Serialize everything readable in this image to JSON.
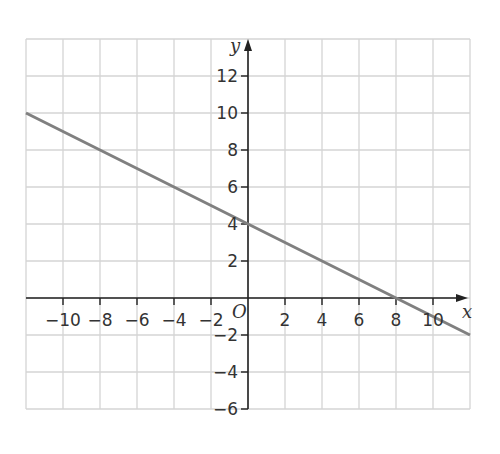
{
  "chart_data": {
    "type": "line",
    "title": "",
    "xlabel": "x",
    "ylabel": "y",
    "origin_label": "O",
    "xlim": [
      -12,
      12
    ],
    "ylim": [
      -6,
      14
    ],
    "grid": true,
    "grid_step": 2,
    "x_ticks": [
      -10,
      -8,
      -6,
      -4,
      -2,
      2,
      4,
      6,
      8,
      10
    ],
    "y_ticks": [
      -6,
      -4,
      -2,
      2,
      4,
      6,
      8,
      10,
      12
    ],
    "x_tick_labels": [
      "−10",
      "−8",
      "−6",
      "−4",
      "−2",
      "2",
      "4",
      "6",
      "8",
      "10"
    ],
    "y_tick_labels": [
      "−6",
      "−4",
      "−2",
      "2",
      "4",
      "6",
      "8",
      "10",
      "12"
    ],
    "series": [
      {
        "name": "line",
        "equation": "y = -x/2 + 4",
        "x": [
          -12,
          0,
          8,
          12
        ],
        "y": [
          10,
          4,
          0,
          -2
        ],
        "color": "#808080"
      }
    ],
    "legend": null
  },
  "colors": {
    "grid": "#d4d4d4",
    "axis": "#222222",
    "line": "#808080"
  }
}
